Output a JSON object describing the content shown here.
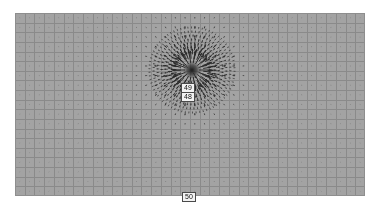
{
  "figure": {
    "title": "",
    "canvas": {
      "width": 380,
      "height": 210,
      "background": "#ffffff"
    },
    "plot_area": {
      "left": 15,
      "top": 13,
      "width": 350,
      "height": 183,
      "background": "#a3a3a3",
      "grid_color": "#8a8a8a",
      "border_color": "#8e8e8e",
      "grid_on": true,
      "grid_cols": 36,
      "grid_rows": 19
    },
    "arrow_color": "#2b2b2b"
  },
  "labels": {
    "upper": "49",
    "lower": "48",
    "bottom": "50"
  },
  "chart_data": {
    "type": "scatter",
    "subtype": "vector-field-quiver",
    "title": "",
    "xlabel": "",
    "ylabel": "",
    "grid": true,
    "legend": "none",
    "xlim": [
      0,
      350
    ],
    "ylim": [
      0,
      183
    ],
    "annotations": [
      {
        "text": "49",
        "x": 192,
        "y": 87,
        "boxed": true
      },
      {
        "text": "48",
        "x": 192,
        "y": 96,
        "boxed": true
      },
      {
        "text": "50",
        "x": 192,
        "y": 196,
        "boxed": true
      }
    ],
    "sources": [
      {
        "x": 177,
        "y": 57,
        "strength": 1.0,
        "kind": "radial-source"
      }
    ],
    "arrow_grid_spacing": {
      "x": 9.72,
      "y": 9.63
    }
  }
}
